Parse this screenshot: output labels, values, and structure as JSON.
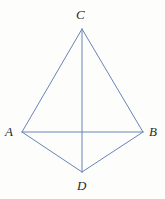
{
  "figure": {
    "type": "geometry-diagram",
    "width": 165,
    "height": 199,
    "background_color": "#fdfdfb",
    "line_color": "#6a83b8",
    "line_width": 1,
    "label_color": "#2b2b2b",
    "points": [
      {
        "name": "C",
        "label": "C",
        "x": 82,
        "y": 29,
        "role": "top-apex"
      },
      {
        "name": "A",
        "label": "A",
        "x": 22,
        "y": 132,
        "role": "left-vertex"
      },
      {
        "name": "B",
        "label": "B",
        "x": 143,
        "y": 132,
        "role": "right-vertex"
      },
      {
        "name": "D",
        "label": "D",
        "x": 82,
        "y": 172,
        "role": "bottom-apex"
      }
    ],
    "segments": [
      {
        "name": "CA",
        "from": "C",
        "to": "A"
      },
      {
        "name": "CB",
        "from": "C",
        "to": "B"
      },
      {
        "name": "AB",
        "from": "A",
        "to": "B"
      },
      {
        "name": "AD",
        "from": "A",
        "to": "D"
      },
      {
        "name": "DB",
        "from": "D",
        "to": "B"
      },
      {
        "name": "CD",
        "from": "C",
        "to": "D"
      }
    ],
    "labels": {
      "C": "C",
      "A": "A",
      "B": "B",
      "D": "D"
    }
  }
}
